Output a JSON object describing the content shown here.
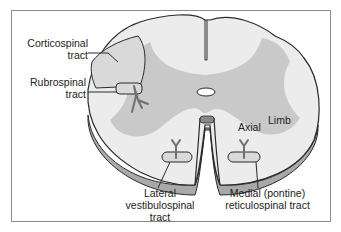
{
  "diagram": {
    "labels": {
      "corticospinal": [
        "Corticospinal",
        "tract"
      ],
      "rubrospinal": [
        "Rubrospinal",
        "tract"
      ],
      "lateral_vestibulospinal": [
        "Lateral",
        "vestibulospinal",
        "tract"
      ],
      "medial_reticulospinal": [
        "Medial (pontine)",
        "reticulospinal tract"
      ],
      "axial": "Axial",
      "limb": "Limb"
    },
    "colors": {
      "white_matter": "#ececec",
      "gray_matter": "#c9c9c9",
      "tract_fill": "#d9d9d9",
      "outline": "#2a2a2a",
      "side_shading": "#a9a9a9",
      "neuron": "#707070",
      "frame_border": "#8a8a8a"
    }
  }
}
